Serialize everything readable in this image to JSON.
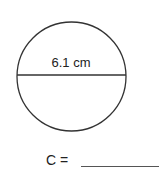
{
  "figure": {
    "shape": "circle",
    "diameter_label": "6.1 cm",
    "stroke_color": "#333333"
  },
  "answer": {
    "label": "C =",
    "blank_value": ""
  }
}
